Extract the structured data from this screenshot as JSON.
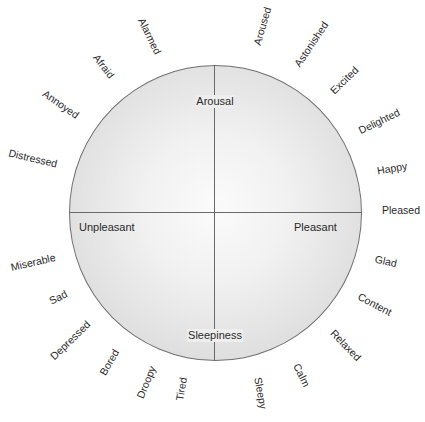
{
  "diagram": {
    "type": "circumplex-model-of-affect",
    "axes": {
      "top": "Arousal",
      "bottom": "Sleepiness",
      "left": "Unpleasant",
      "right": "Pleasant"
    },
    "colors": {
      "circle_border": "#707070",
      "axis_line": "#6a6a6a",
      "circle_center": "#fbfbfb",
      "circle_edge": "#cdcdcd",
      "text": "#2a2a2a"
    },
    "emotions": [
      {
        "label": "Alarmed",
        "x": 150,
        "y": 36,
        "rotate": 64
      },
      {
        "label": "Afraid",
        "x": 104,
        "y": 66,
        "rotate": 52
      },
      {
        "label": "Annoyed",
        "x": 61,
        "y": 104,
        "rotate": 35
      },
      {
        "label": "Distressed",
        "x": 33,
        "y": 158,
        "rotate": 13
      },
      {
        "label": "Aroused",
        "x": 262,
        "y": 26,
        "rotate": -74
      },
      {
        "label": "Astonished",
        "x": 311,
        "y": 44,
        "rotate": -56
      },
      {
        "label": "Excited",
        "x": 344,
        "y": 80,
        "rotate": -44
      },
      {
        "label": "Delighted",
        "x": 379,
        "y": 121,
        "rotate": -26
      },
      {
        "label": "Happy",
        "x": 392,
        "y": 168,
        "rotate": -10
      },
      {
        "label": "Pleased",
        "x": 401,
        "y": 210,
        "rotate": 0
      },
      {
        "label": "Glad",
        "x": 386,
        "y": 261,
        "rotate": 12
      },
      {
        "label": "Content",
        "x": 375,
        "y": 304,
        "rotate": 28
      },
      {
        "label": "Relaxed",
        "x": 346,
        "y": 345,
        "rotate": 46
      },
      {
        "label": "Calm",
        "x": 302,
        "y": 375,
        "rotate": 64
      },
      {
        "label": "Sleepy",
        "x": 261,
        "y": 393,
        "rotate": 80
      },
      {
        "label": "Tired",
        "x": 181,
        "y": 389,
        "rotate": -80
      },
      {
        "label": "Droopy",
        "x": 146,
        "y": 382,
        "rotate": -68
      },
      {
        "label": "Bored",
        "x": 109,
        "y": 362,
        "rotate": -60
      },
      {
        "label": "Depressed",
        "x": 70,
        "y": 340,
        "rotate": -44
      },
      {
        "label": "Sad",
        "x": 58,
        "y": 297,
        "rotate": -27
      },
      {
        "label": "Miserable",
        "x": 33,
        "y": 262,
        "rotate": -13
      }
    ]
  }
}
